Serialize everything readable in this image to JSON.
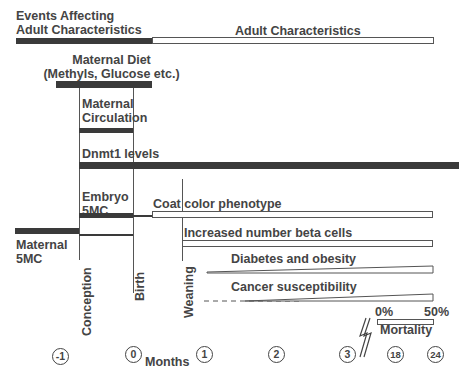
{
  "header": {
    "events_title_line1": "Events Affecting",
    "events_title_line2": "Adult Characteristics",
    "adult_title": "Adult Characteristics"
  },
  "bars": {
    "maternal_diet_line1": "Maternal Diet",
    "maternal_diet_line2": "(Methyls, Glucose etc.)",
    "maternal_circulation_line1": "Maternal",
    "maternal_circulation_line2": "Circulation",
    "dnmt1": "Dnmt1 levels",
    "embryo_line1": "Embryo",
    "embryo_line2": "5MC",
    "coat_color": "Coat color phenotype",
    "beta_cells": "Increased number beta cells",
    "diabetes": "Diabetes and obesity",
    "cancer": "Cancer susceptibility",
    "maternal5mc_line1": "Maternal",
    "maternal5mc_line2": "5MC"
  },
  "milestones": {
    "conception": "Conception",
    "birth": "Birth",
    "weaning": "Weaning"
  },
  "mortality": {
    "low": "0%",
    "high": "50%",
    "label": "Mortality"
  },
  "timeline": {
    "unit_label": "Months",
    "ticks": [
      "-1",
      "0",
      "1",
      "2",
      "3",
      "18",
      "24"
    ]
  }
}
